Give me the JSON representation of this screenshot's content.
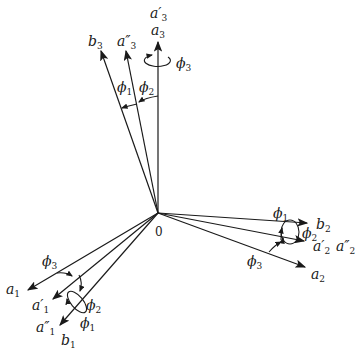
{
  "diagram": {
    "type": "rotation-axes",
    "origin_label": "0",
    "origin": [
      158,
      213
    ],
    "axes": [
      {
        "id": "a3",
        "label": "a",
        "sub": "3",
        "tip": [
          158,
          41
        ]
      },
      {
        "id": "a3p",
        "label": "a′",
        "sub": "3",
        "tip": [
          158,
          41
        ]
      },
      {
        "id": "a3pp",
        "label": "a″",
        "sub": "3",
        "tip": [
          126,
          50
        ]
      },
      {
        "id": "b3",
        "label": "b",
        "sub": "3",
        "tip": [
          101,
          50
        ]
      },
      {
        "id": "a1",
        "label": "a",
        "sub": "1",
        "tip": [
          27,
          291
        ]
      },
      {
        "id": "a1p",
        "label": "a′",
        "sub": "1",
        "tip": [
          52,
          300
        ]
      },
      {
        "id": "a1pp",
        "label": "a″",
        "sub": "1",
        "tip": [
          59,
          326
        ]
      },
      {
        "id": "b1",
        "label": "b",
        "sub": "1",
        "tip": [
          59,
          326
        ]
      },
      {
        "id": "b2",
        "label": "b",
        "sub": "2",
        "tip": [
          308,
          223
        ]
      },
      {
        "id": "a2p",
        "label": "a′",
        "sub": "2",
        "tip": [
          305,
          241
        ]
      },
      {
        "id": "a2pp",
        "label": "a″",
        "sub": "2",
        "tip": [
          305,
          241
        ]
      },
      {
        "id": "a2",
        "label": "a",
        "sub": "2",
        "tip": [
          306,
          268
        ]
      }
    ],
    "angles": [
      {
        "label": "ϕ",
        "sub": "1"
      },
      {
        "label": "ϕ",
        "sub": "2"
      },
      {
        "label": "ϕ",
        "sub": "3"
      }
    ]
  }
}
